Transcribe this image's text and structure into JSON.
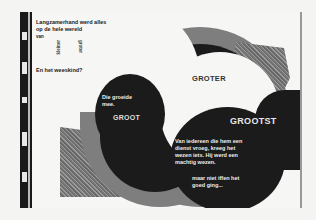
{
  "page": {
    "type": "picture-book spread (scan)",
    "language": "nl",
    "colors": {
      "paper": "#f6f6f4",
      "black": "#1b1b1b",
      "gray": "#7e7e7e",
      "hatch": "#8a8a8a"
    }
  },
  "left_page": {
    "intro_lines": [
      "Langzamerhand werd alles",
      "op de hele wereld",
      "van"
    ],
    "curved_words": [
      "kleiner",
      "groter"
    ],
    "question": "En het weeskind?",
    "circle_text": [
      "Die groeide",
      "mee."
    ],
    "label_groot": "GROOT"
  },
  "center": {
    "label_groter": "GROTER"
  },
  "right_page": {
    "label_grootst": "GROOTST",
    "body_lines": [
      "Van iedereen die hem een",
      "dienst vroeg, kreeg het",
      "wezen iets. Hij werd een",
      "machtig wezen."
    ],
    "closing_lines": [
      "maar niet iffen het",
      "goed ging..."
    ]
  }
}
